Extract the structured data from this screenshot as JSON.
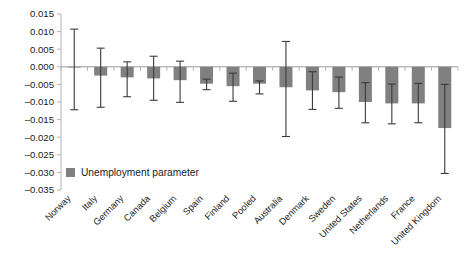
{
  "chart_data": {
    "type": "bar",
    "title": "",
    "subtitle": "",
    "xlabel": "",
    "ylabel": "",
    "ylim": [
      -0.035,
      0.015
    ],
    "ytick_step": 0.005,
    "ytick_labels": [
      "0.015",
      "0.010",
      "0.005",
      "0.000",
      "–0.005",
      "–0.010",
      "–0.015",
      "–0.020",
      "–0.025",
      "–0.030",
      "–0.035"
    ],
    "ytick_values": [
      0.015,
      0.01,
      0.005,
      0.0,
      -0.005,
      -0.01,
      -0.015,
      -0.02,
      -0.025,
      -0.03,
      -0.035
    ],
    "grid": false,
    "legend_position": "inside-lower-left",
    "bar_color": "#808080",
    "error_bar_color": "#3a3a3a",
    "axis_color": "#b4b4b4",
    "zero_line_color": "#9a9a9a",
    "categories": [
      "Norway",
      "Italy",
      "Germany",
      "Canada",
      "Belgium",
      "Spain",
      "Finland",
      "Pooled",
      "Australia",
      "Denmark",
      "Sweden",
      "United States",
      "Netherlands",
      "France",
      "United Kingdom"
    ],
    "series": [
      {
        "name": "Unemployment parameter",
        "values": [
          -0.0002,
          -0.0025,
          -0.003,
          -0.0033,
          -0.0038,
          -0.0048,
          -0.0055,
          -0.0048,
          -0.0058,
          -0.0067,
          -0.0072,
          -0.01,
          -0.0104,
          -0.0104,
          -0.0174
        ],
        "error_low": [
          -0.0122,
          -0.0115,
          -0.0085,
          -0.0095,
          -0.0101,
          -0.0065,
          -0.0098,
          -0.0077,
          -0.0198,
          -0.0121,
          -0.0118,
          -0.0159,
          -0.0162,
          -0.0159,
          -0.0303
        ],
        "error_high": [
          0.0107,
          0.0053,
          0.0014,
          0.003,
          0.0016,
          -0.0035,
          -0.0018,
          -0.004,
          0.0072,
          -0.0014,
          -0.0029,
          -0.0045,
          -0.0049,
          -0.0047,
          -0.005
        ]
      }
    ]
  },
  "legend": {
    "items": [
      {
        "label": "Unemployment parameter",
        "color": "#808080"
      }
    ]
  }
}
